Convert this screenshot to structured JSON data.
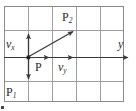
{
  "figure": {
    "kind": "vector-decomposition-grid-diagram",
    "background_color": "#ffffff",
    "grid": {
      "border_color": "#8a8a8a",
      "line_color": "#9a9a9a",
      "columns": 5,
      "rows": 4,
      "x_left": 4,
      "x_right": 124,
      "y_top": 6,
      "y_bottom": 102,
      "vertical_lines": [
        4,
        28,
        52,
        76,
        100,
        124
      ],
      "horizontal_lines": [
        6,
        30,
        54,
        78,
        102
      ]
    },
    "axis": {
      "label": "y",
      "label_style": "italic",
      "color": "#3a3a3a",
      "arrow_tip_x": 132,
      "y": 57
    },
    "origin": {
      "label": "P",
      "x": 28,
      "y": 57,
      "dot_color": "#222222"
    },
    "vectors": [
      {
        "name": "v-x-up-arrow",
        "label": "v",
        "subscript": "x",
        "style": "solid",
        "from": [
          28,
          57
        ],
        "to": [
          28,
          31
        ],
        "color": "#3a3a3a"
      },
      {
        "name": "v-x-down-arrow",
        "label": "",
        "subscript": "",
        "style": "solid",
        "from": [
          28,
          57
        ],
        "to": [
          28,
          82
        ],
        "color": "#3a3a3a"
      },
      {
        "name": "v-y-solid-arrow",
        "label": "",
        "subscript": "",
        "style": "solid",
        "from": [
          28,
          57
        ],
        "to": [
          52,
          57
        ],
        "color": "#3a3a3a"
      },
      {
        "name": "v-y-dashed-arrow",
        "label": "v",
        "subscript": "y",
        "style": "dashed",
        "from": [
          52,
          57
        ],
        "to": [
          76,
          57
        ],
        "color": "#3a3a3a"
      },
      {
        "name": "resultant-arrow-to-P2",
        "label": "",
        "subscript": "",
        "style": "solid",
        "from": [
          28,
          57
        ],
        "to": [
          76,
          30
        ],
        "color": "#3a3a3a"
      }
    ],
    "points": [
      {
        "name": "point-P2",
        "label": "P",
        "subscript": "2",
        "x": 62,
        "y": 11
      },
      {
        "name": "point-P1",
        "label": "P",
        "subscript": "1",
        "x": 6,
        "y": 86
      },
      {
        "name": "point-P",
        "label": "P",
        "subscript": "",
        "x": 35,
        "y": 61
      }
    ],
    "labels": {
      "p2": "P",
      "p2_sub": "2",
      "p1": "P",
      "p1_sub": "1",
      "p": "P",
      "vx": "v",
      "vx_sub": "x",
      "vy": "v",
      "vy_sub": "y",
      "y_axis": "y"
    },
    "corner_mark": {
      "name": "bottom-left-corner-mark",
      "x": 1,
      "y": 106,
      "size": 3,
      "color": "#444444"
    }
  }
}
